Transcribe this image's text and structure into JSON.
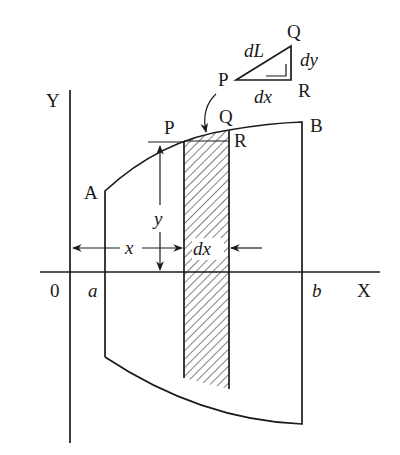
{
  "diagram": {
    "type": "area-and-arc-length-strip",
    "colors": {
      "ink": "#1a1a1a",
      "background": "#ffffff"
    },
    "axes": {
      "y_label": "Y",
      "x_label": "X",
      "origin_label": "0"
    },
    "region": {
      "left_bound_label": "a",
      "right_bound_label": "b",
      "curve_start_label": "A",
      "curve_end_label": "B"
    },
    "strip": {
      "point_left_label": "P",
      "point_top_right_label": "Q",
      "point_bottom_right_label": "R",
      "height_label": "y",
      "distance_label": "x",
      "width_label": "dx"
    },
    "inset_triangle": {
      "vertex_p": "P",
      "vertex_q": "Q",
      "vertex_r": "R",
      "hypotenuse_label": "dL",
      "vertical_leg_label": "dy",
      "horizontal_leg_label": "dx"
    }
  }
}
